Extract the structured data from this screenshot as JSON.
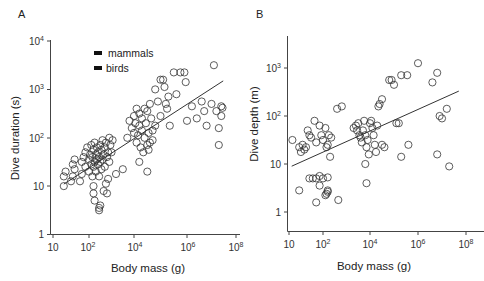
{
  "chart_data": [
    {
      "panel": "A",
      "type": "scatter",
      "xlabel": "Body mass (g)",
      "ylabel": "Dive duration (s)",
      "xscale": "log",
      "yscale": "log",
      "xlim": [
        10,
        100000000
      ],
      "ylim": [
        1,
        10000
      ],
      "x_ticks": [
        "10",
        "10^2",
        "10^4",
        "10^6",
        "10^8"
      ],
      "y_ticks": [
        "1",
        "10",
        "10^2",
        "10^3",
        "10^4"
      ],
      "legend": [
        "mammals",
        "birds"
      ],
      "legend_position": "upper-left",
      "grid": false,
      "regression_line": {
        "x": [
          20,
          30000000
        ],
        "y": [
          11,
          1500
        ]
      },
      "points_log10": [
        [
          1.3,
          1.0
        ],
        [
          1.3,
          1.2
        ],
        [
          1.35,
          1.3
        ],
        [
          1.5,
          1.1
        ],
        [
          1.55,
          1.2
        ],
        [
          1.55,
          1.45
        ],
        [
          1.6,
          1.55
        ],
        [
          1.6,
          1.35
        ],
        [
          1.75,
          1.1
        ],
        [
          1.8,
          1.25
        ],
        [
          1.8,
          1.5
        ],
        [
          1.85,
          1.6
        ],
        [
          1.9,
          1.7
        ],
        [
          1.9,
          1.4
        ],
        [
          1.95,
          1.8
        ],
        [
          2.0,
          1.55
        ],
        [
          2.0,
          1.3
        ],
        [
          2.05,
          1.65
        ],
        [
          2.1,
          1.45
        ],
        [
          2.1,
          1.85
        ],
        [
          2.15,
          1.2
        ],
        [
          2.15,
          1.6
        ],
        [
          2.2,
          1.75
        ],
        [
          2.2,
          1.4
        ],
        [
          2.25,
          1.5
        ],
        [
          2.25,
          1.9
        ],
        [
          2.3,
          1.3
        ],
        [
          2.3,
          1.65
        ],
        [
          2.35,
          1.55
        ],
        [
          2.35,
          1.8
        ],
        [
          2.4,
          1.45
        ],
        [
          2.4,
          1.7
        ],
        [
          2.45,
          1.2
        ],
        [
          2.45,
          1.6
        ],
        [
          2.5,
          1.85
        ],
        [
          2.5,
          1.5
        ],
        [
          2.55,
          1.35
        ],
        [
          2.55,
          1.75
        ],
        [
          2.6,
          1.95
        ],
        [
          2.6,
          1.55
        ],
        [
          2.65,
          1.65
        ],
        [
          2.7,
          1.8
        ],
        [
          2.7,
          1.4
        ],
        [
          2.75,
          1.9
        ],
        [
          2.8,
          1.6
        ],
        [
          2.85,
          1.7
        ],
        [
          2.9,
          1.5
        ],
        [
          2.9,
          2.0
        ],
        [
          2.95,
          1.85
        ],
        [
          3.0,
          1.7
        ],
        [
          3.05,
          1.95
        ],
        [
          2.2,
          1.0
        ],
        [
          2.2,
          0.85
        ],
        [
          2.25,
          0.7
        ],
        [
          2.45,
          0.55
        ],
        [
          2.45,
          0.5
        ],
        [
          2.5,
          0.6
        ],
        [
          2.65,
          0.9
        ],
        [
          2.8,
          0.85
        ],
        [
          2.85,
          1.15
        ],
        [
          2.75,
          1.05
        ],
        [
          3.2,
          1.25
        ],
        [
          3.5,
          1.35
        ],
        [
          3.7,
          2.0
        ],
        [
          3.8,
          2.35
        ],
        [
          3.9,
          2.2
        ],
        [
          4.0,
          2.1
        ],
        [
          4.0,
          2.45
        ],
        [
          4.05,
          2.3
        ],
        [
          4.1,
          1.9
        ],
        [
          4.1,
          2.6
        ],
        [
          4.15,
          2.05
        ],
        [
          4.2,
          2.25
        ],
        [
          4.2,
          2.5
        ],
        [
          4.25,
          1.8
        ],
        [
          4.3,
          2.15
        ],
        [
          4.3,
          2.4
        ],
        [
          4.35,
          1.7
        ],
        [
          4.4,
          2.0
        ],
        [
          4.4,
          2.6
        ],
        [
          4.45,
          2.3
        ],
        [
          4.5,
          1.85
        ],
        [
          4.5,
          2.55
        ],
        [
          4.55,
          2.1
        ],
        [
          4.6,
          2.7
        ],
        [
          4.65,
          2.4
        ],
        [
          4.7,
          1.95
        ],
        [
          4.7,
          2.15
        ],
        [
          4.8,
          2.25
        ],
        [
          4.2,
          1.5
        ],
        [
          4.5,
          1.3
        ],
        [
          4.55,
          1.75
        ],
        [
          4.6,
          1.9
        ],
        [
          4.8,
          3.0
        ],
        [
          4.9,
          2.75
        ],
        [
          5.0,
          3.2
        ],
        [
          5.1,
          3.2
        ],
        [
          5.15,
          3.05
        ],
        [
          5.0,
          2.45
        ],
        [
          5.2,
          2.7
        ],
        [
          5.3,
          2.85
        ],
        [
          5.25,
          2.6
        ],
        [
          5.35,
          2.25
        ],
        [
          5.5,
          3.35
        ],
        [
          5.6,
          2.9
        ],
        [
          5.75,
          3.35
        ],
        [
          5.9,
          3.35
        ],
        [
          5.95,
          3.15
        ],
        [
          6.0,
          2.35
        ],
        [
          6.2,
          2.65
        ],
        [
          6.4,
          2.4
        ],
        [
          6.6,
          2.75
        ],
        [
          6.7,
          2.55
        ],
        [
          6.8,
          2.25
        ],
        [
          7.1,
          3.5
        ],
        [
          7.0,
          2.7
        ],
        [
          7.2,
          2.55
        ],
        [
          7.3,
          2.2
        ],
        [
          7.4,
          2.65
        ],
        [
          7.45,
          2.62
        ],
        [
          7.3,
          1.85
        ],
        [
          7.4,
          2.45
        ]
      ]
    },
    {
      "panel": "B",
      "type": "scatter",
      "xlabel": "Body mass (g)",
      "ylabel": "Dive depth (m)",
      "xscale": "log",
      "yscale": "log",
      "xlim": [
        10,
        100000000
      ],
      "ylim": [
        0.5,
        3000
      ],
      "x_ticks": [
        "10",
        "10^2",
        "10^4",
        "10^6",
        "10^8"
      ],
      "y_ticks": [
        "1",
        "10",
        "10^2",
        "10^3"
      ],
      "grid": false,
      "regression_line": {
        "x": [
          12,
          50000000
        ],
        "y": [
          9,
          330
        ]
      },
      "points_log10": [
        [
          1.1,
          1.5
        ],
        [
          1.3,
          1.35
        ],
        [
          1.35,
          1.25
        ],
        [
          1.4,
          1.4
        ],
        [
          1.45,
          1.3
        ],
        [
          1.5,
          1.35
        ],
        [
          1.55,
          1.7
        ],
        [
          1.6,
          1.6
        ],
        [
          1.65,
          1.55
        ],
        [
          1.75,
          1.9
        ],
        [
          1.8,
          1.45
        ],
        [
          1.9,
          1.8
        ],
        [
          1.95,
          1.6
        ],
        [
          2.0,
          1.5
        ],
        [
          2.1,
          1.75
        ],
        [
          2.15,
          1.35
        ],
        [
          2.2,
          1.4
        ],
        [
          2.25,
          1.6
        ],
        [
          2.3,
          1.15
        ],
        [
          2.35,
          1.55
        ],
        [
          1.6,
          0.7
        ],
        [
          1.7,
          0.7
        ],
        [
          1.8,
          0.7
        ],
        [
          1.9,
          0.75
        ],
        [
          2.0,
          0.7
        ],
        [
          2.2,
          0.72
        ],
        [
          1.3,
          0.45
        ],
        [
          1.9,
          0.55
        ],
        [
          2.2,
          0.45
        ],
        [
          2.2,
          0.42
        ],
        [
          2.15,
          0.38
        ],
        [
          2.1,
          0.35
        ],
        [
          1.8,
          0.2
        ],
        [
          2.65,
          0.25
        ],
        [
          2.6,
          2.15
        ],
        [
          2.8,
          2.2
        ],
        [
          3.3,
          1.75
        ],
        [
          3.4,
          1.8
        ],
        [
          3.45,
          1.7
        ],
        [
          3.5,
          1.85
        ],
        [
          3.55,
          1.6
        ],
        [
          3.6,
          1.55
        ],
        [
          3.65,
          1.45
        ],
        [
          3.7,
          1.7
        ],
        [
          3.75,
          1.9
        ],
        [
          3.8,
          1.6
        ],
        [
          3.85,
          1.35
        ],
        [
          3.9,
          1.5
        ],
        [
          3.95,
          1.2
        ],
        [
          4.0,
          1.85
        ],
        [
          4.05,
          1.9
        ],
        [
          4.1,
          1.75
        ],
        [
          4.15,
          1.6
        ],
        [
          4.2,
          1.4
        ],
        [
          4.25,
          1.25
        ],
        [
          4.3,
          1.8
        ],
        [
          4.35,
          2.2
        ],
        [
          4.4,
          2.25
        ],
        [
          4.5,
          2.35
        ],
        [
          3.8,
          1.0
        ],
        [
          3.85,
          0.6
        ],
        [
          4.5,
          1.4
        ],
        [
          4.6,
          1.35
        ],
        [
          4.8,
          2.75
        ],
        [
          4.9,
          2.75
        ],
        [
          5.0,
          2.65
        ],
        [
          5.1,
          1.85
        ],
        [
          5.2,
          1.85
        ],
        [
          5.3,
          2.85
        ],
        [
          5.55,
          2.85
        ],
        [
          5.3,
          1.15
        ],
        [
          5.6,
          1.4
        ],
        [
          6.0,
          3.1
        ],
        [
          6.6,
          2.7
        ],
        [
          6.8,
          1.2
        ],
        [
          6.8,
          2.9
        ],
        [
          6.9,
          2.0
        ],
        [
          7.0,
          1.95
        ],
        [
          7.2,
          2.15
        ],
        [
          7.3,
          0.95
        ]
      ]
    }
  ],
  "panels": {
    "a": {
      "label": "A",
      "xlabel": "Body mass (g)",
      "ylabel": "Dive duration (s)",
      "legend": {
        "mammals": "mammals",
        "birds": "birds"
      }
    },
    "b": {
      "label": "B",
      "xlabel": "Body mass (g)",
      "ylabel": "Dive depth (m)"
    }
  }
}
